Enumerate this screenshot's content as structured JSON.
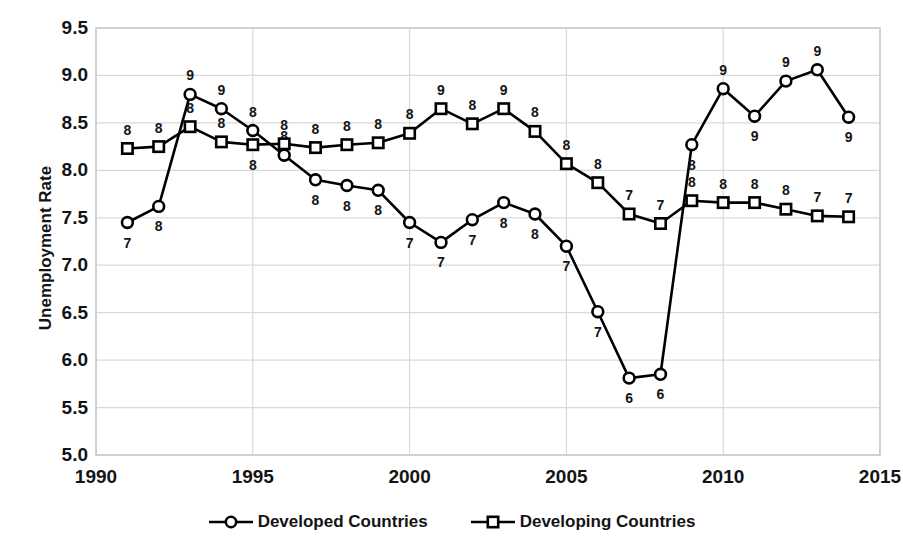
{
  "chart_data": {
    "type": "line",
    "title": "",
    "xlabel": "",
    "ylabel": "Unemployment Rate",
    "xlim": [
      1990,
      2015
    ],
    "ylim": [
      5.0,
      9.5
    ],
    "xticks": [
      1990,
      1995,
      2000,
      2005,
      2010,
      2015
    ],
    "ytick_labels": [
      "9.5",
      "9.0",
      "8.5",
      "8.0",
      "7.5",
      "7.0",
      "6.5",
      "6.0",
      "5.5",
      "5.0"
    ],
    "yticks": [
      9.5,
      9.0,
      8.5,
      8.0,
      7.5,
      7.0,
      6.5,
      6.0,
      5.5,
      5.0
    ],
    "grid": true,
    "legend_position": "bottom",
    "x": [
      1991,
      1992,
      1993,
      1994,
      1995,
      1996,
      1997,
      1998,
      1999,
      2000,
      2001,
      2002,
      2003,
      2004,
      2005,
      2006,
      2007,
      2008,
      2009,
      2010,
      2011,
      2012,
      2013,
      2014
    ],
    "series": [
      {
        "name": "Developed Countries",
        "marker": "circle",
        "values": [
          7.45,
          7.62,
          8.8,
          8.65,
          8.42,
          8.16,
          7.9,
          7.84,
          7.79,
          7.45,
          7.24,
          7.48,
          7.66,
          7.54,
          7.2,
          6.51,
          5.81,
          5.85,
          8.27,
          8.86,
          8.57,
          8.94,
          9.06,
          8.56
        ],
        "labels": [
          "7",
          "8",
          "9",
          "9",
          "8",
          "8",
          "8",
          "8",
          "8",
          "7",
          "7",
          "7",
          "8",
          "8",
          "7",
          "7",
          "6",
          "6",
          "8",
          "9",
          "9",
          "9",
          "9",
          "9"
        ],
        "label_offsets": [
          "below",
          "below",
          "above",
          "above",
          "above",
          "above",
          "below",
          "below",
          "below",
          "below",
          "below",
          "below",
          "below",
          "below",
          "below",
          "below",
          "below",
          "below",
          "below",
          "above",
          "below",
          "above",
          "above",
          "below"
        ]
      },
      {
        "name": "Developing Countries",
        "marker": "square",
        "values": [
          8.23,
          8.25,
          8.46,
          8.3,
          8.27,
          8.28,
          8.24,
          8.27,
          8.29,
          8.39,
          8.65,
          8.49,
          8.65,
          8.41,
          8.07,
          7.87,
          7.54,
          7.44,
          7.68,
          7.66,
          7.66,
          7.59,
          7.52,
          7.51
        ],
        "labels": [
          "8",
          "8",
          "8",
          "8",
          "8",
          "8",
          "8",
          "8",
          "8",
          "8",
          "9",
          "8",
          "9",
          "8",
          "8",
          "8",
          "7",
          "7",
          "8",
          "8",
          "8",
          "8",
          "7",
          "7"
        ],
        "label_offsets": [
          "above",
          "above",
          "above",
          "above",
          "below",
          "above",
          "above",
          "above",
          "above",
          "above",
          "above",
          "above",
          "above",
          "above",
          "above",
          "above",
          "above",
          "above",
          "above",
          "above",
          "above",
          "above",
          "above",
          "above"
        ]
      }
    ]
  },
  "axis": {
    "y_title": "Unemployment Rate"
  },
  "legend": {
    "items": [
      {
        "label": "Developed Countries",
        "marker": "circle"
      },
      {
        "label": "Developing Countries",
        "marker": "square"
      }
    ]
  },
  "colors": {
    "line": "#000000",
    "text": "#141414",
    "grid": "#d9d9d9",
    "background": "#ffffff"
  }
}
